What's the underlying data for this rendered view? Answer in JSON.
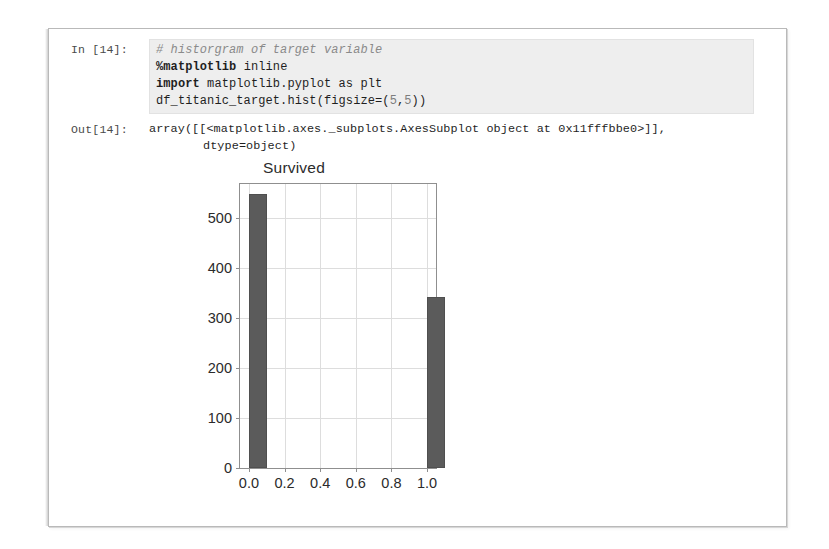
{
  "notebook": {
    "input_prompt": "In [14]:",
    "output_prompt": "Out[14]:",
    "code_lines": [
      "# historgram of target variable",
      "%matplotlib inline",
      "import matplotlib.pyplot as plt",
      "df_titanic_target.hist(figsize=(5,5))"
    ],
    "code_tokens": {
      "line1_comment": "# historgram of target variable",
      "line2_magic": "%matplotlib",
      "line2_rest": " inline",
      "line3_kw": "import",
      "line3_rest": " matplotlib.pyplot as plt",
      "line4_a": "df_titanic_target.hist(figsize=(",
      "line4_n1": "5",
      "line4_comma": ",",
      "line4_n2": "5",
      "line4_b": "))"
    },
    "output_lines": [
      "array([[<matplotlib.axes._subplots.AxesSubplot object at 0x11fffbbe0>]],",
      "dtype=object)"
    ],
    "colors": {
      "code_cell_background": "#eeeeee",
      "page_border": "#b9b9b9",
      "text": "#1f1f1f"
    }
  },
  "chart_data": {
    "type": "bar",
    "title": "Survived",
    "xlabel": "",
    "ylabel": "",
    "x": [
      0.0,
      1.0
    ],
    "values": [
      549,
      342
    ],
    "bar_width": 0.1,
    "xlim": [
      -0.05,
      1.05
    ],
    "ylim": [
      0,
      568
    ],
    "xticks": [
      0.0,
      0.2,
      0.4,
      0.6,
      0.8,
      1.0
    ],
    "xtick_labels": [
      "0.0",
      "0.2",
      "0.4",
      "0.6",
      "0.8",
      "1.0"
    ],
    "yticks": [
      0,
      100,
      200,
      300,
      400,
      500
    ],
    "ytick_labels": [
      "0",
      "100",
      "200",
      "300",
      "400",
      "500"
    ],
    "grid": true,
    "legend": "none",
    "bar_color": "#5b5b5b",
    "grid_color": "#dddddd",
    "axis_color": "#8f8f8f"
  }
}
